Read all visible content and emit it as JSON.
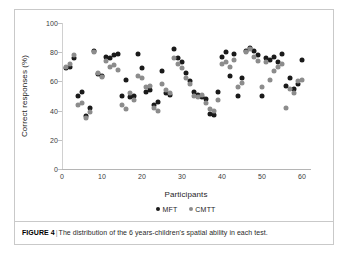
{
  "figure": {
    "caption_label": "FIGURE 4",
    "caption_separator": "|",
    "caption_text": "The distribution of the 6 years-children's spatial ability in each test."
  },
  "colors": {
    "mft": "#1a1a1a",
    "cmtt": "#8c8c8c",
    "axis": "#c2c2c2",
    "frame": "#c9c9c9",
    "text": "#2a2a2a"
  },
  "chart_data": {
    "type": "scatter",
    "title": "",
    "xlabel": "Participants",
    "ylabel": "Correct responses (%)",
    "xlim": [
      0,
      62
    ],
    "ylim": [
      0,
      100
    ],
    "xticks": [
      0,
      10,
      20,
      30,
      40,
      50,
      60
    ],
    "yticks": [
      0,
      20,
      40,
      60,
      80,
      100
    ],
    "grid": false,
    "legend_position": "bottom-center",
    "series": [
      {
        "name": "MFT",
        "color": "#1a1a1a",
        "x": [
          1,
          2,
          3,
          4,
          5,
          6,
          7,
          8,
          9,
          10,
          11,
          12,
          13,
          14,
          15,
          16,
          17,
          18,
          19,
          20,
          21,
          22,
          23,
          24,
          25,
          26,
          27,
          28,
          29,
          30,
          31,
          32,
          33,
          34,
          35,
          36,
          37,
          38,
          39,
          40,
          41,
          42,
          43,
          44,
          45,
          46,
          47,
          48,
          49,
          50,
          51,
          52,
          53,
          54,
          55,
          56,
          57,
          58,
          59,
          60
        ],
        "y": [
          69,
          70,
          76,
          50,
          53,
          36,
          42,
          81,
          65,
          64,
          77,
          76,
          78,
          79,
          50,
          61,
          49,
          50,
          79,
          69,
          53,
          54,
          44,
          46,
          67,
          52,
          51,
          82,
          76,
          73,
          66,
          60,
          53,
          51,
          49,
          48,
          38,
          37,
          53,
          77,
          80,
          64,
          79,
          50,
          62,
          81,
          83,
          81,
          78,
          50,
          76,
          75,
          77,
          73,
          79,
          57,
          62,
          55,
          58,
          75
        ]
      },
      {
        "name": "CMTT",
        "color": "#8c8c8c",
        "x": [
          1,
          2,
          3,
          4,
          5,
          6,
          7,
          8,
          9,
          10,
          11,
          12,
          13,
          14,
          15,
          16,
          17,
          18,
          19,
          20,
          21,
          22,
          23,
          24,
          25,
          26,
          27,
          28,
          29,
          30,
          31,
          32,
          33,
          34,
          35,
          36,
          37,
          38,
          39,
          40,
          41,
          42,
          43,
          44,
          45,
          46,
          47,
          48,
          49,
          50,
          51,
          52,
          53,
          54,
          55,
          56,
          57,
          58,
          59,
          60
        ],
        "y": [
          70,
          72,
          78,
          44,
          45,
          35,
          39,
          80,
          66,
          63,
          74,
          70,
          71,
          68,
          44,
          41,
          52,
          47,
          64,
          62,
          56,
          57,
          42,
          40,
          58,
          54,
          52,
          76,
          72,
          69,
          62,
          58,
          50,
          49,
          51,
          45,
          41,
          40,
          47,
          72,
          73,
          70,
          75,
          56,
          59,
          80,
          82,
          77,
          74,
          56,
          73,
          61,
          67,
          70,
          72,
          42,
          55,
          52,
          60,
          61
        ]
      }
    ]
  },
  "legend": {
    "items": [
      {
        "label": "MFT",
        "color": "#1a1a1a"
      },
      {
        "label": "CMTT",
        "color": "#8c8c8c"
      }
    ]
  }
}
